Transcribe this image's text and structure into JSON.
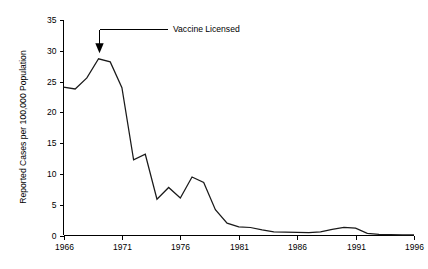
{
  "chart_data": {
    "type": "line",
    "title": "",
    "xlabel": "",
    "ylabel": "Reported Cases per 100,000 Population",
    "xlim": [
      1966,
      1996
    ],
    "ylim": [
      0,
      35
    ],
    "grid": false,
    "legend": "none",
    "x_ticks": [
      1966,
      1971,
      1976,
      1981,
      1986,
      1991,
      1996
    ],
    "x_tick_labels": [
      "1966",
      "1971",
      "1976",
      "1981",
      "1986",
      "1991",
      "1996"
    ],
    "y_ticks": [
      0,
      5,
      10,
      15,
      20,
      25,
      30,
      35
    ],
    "y_tick_labels": [
      "0",
      "5",
      "10",
      "15",
      "20",
      "25",
      "30",
      "35"
    ],
    "series": [
      {
        "name": "Reported cases per 100,000 population",
        "color": "#1a1a1a",
        "x": [
          1966,
          1967,
          1968,
          1969,
          1970,
          1971,
          1972,
          1973,
          1974,
          1975,
          1976,
          1977,
          1978,
          1979,
          1980,
          1981,
          1982,
          1983,
          1984,
          1985,
          1986,
          1987,
          1988,
          1989,
          1990,
          1991,
          1992,
          1993,
          1994,
          1995,
          1996
        ],
        "values": [
          24.1,
          23.8,
          25.6,
          28.7,
          28.2,
          24.0,
          12.3,
          13.2,
          5.9,
          7.8,
          6.1,
          9.5,
          8.6,
          4.2,
          2.0,
          1.4,
          1.3,
          0.9,
          0.6,
          0.55,
          0.5,
          0.45,
          0.6,
          1.0,
          1.3,
          1.2,
          0.35,
          0.2,
          0.15,
          0.12,
          0.1
        ]
      }
    ],
    "annotations": [
      {
        "label": "Vaccine Licensed",
        "x": 1969,
        "pointer": "down-arrow",
        "target_value": 29.6
      }
    ]
  },
  "colors": {
    "background": "#ffffff",
    "axis": "#000000",
    "line": "#1a1a1a",
    "text": "#000000"
  }
}
